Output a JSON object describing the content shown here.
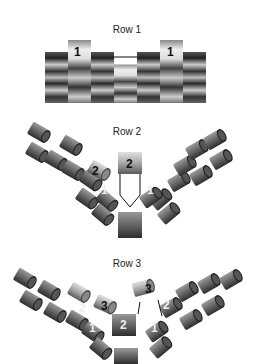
{
  "panels": [
    {
      "id": "row1",
      "title": "Row 1",
      "labels": [
        {
          "text": "1",
          "x": 79,
          "y": 55,
          "color": "#111"
        },
        {
          "text": "1",
          "x": 172,
          "y": 55,
          "color": "#111"
        }
      ]
    },
    {
      "id": "row2",
      "title": "Row 2",
      "labels": [
        {
          "text": "2",
          "x": 128,
          "y": 164,
          "color": "#111"
        },
        {
          "text": "2",
          "x": 95,
          "y": 172,
          "color": "#111"
        },
        {
          "text": "1",
          "x": 104,
          "y": 192,
          "color": "#eee"
        },
        {
          "text": "1",
          "x": 150,
          "y": 192,
          "color": "#eee"
        }
      ]
    },
    {
      "id": "row3",
      "title": "Row 3",
      "labels": [
        {
          "text": "3",
          "x": 148,
          "y": 292,
          "color": "#111"
        },
        {
          "text": "3",
          "x": 104,
          "y": 308,
          "color": "#111"
        },
        {
          "text": "2",
          "x": 82,
          "y": 310,
          "color": "#eee"
        },
        {
          "text": "2",
          "x": 166,
          "y": 307,
          "color": "#eee"
        },
        {
          "text": "2",
          "x": 123,
          "y": 326,
          "color": "#eee"
        },
        {
          "text": "1",
          "x": 92,
          "y": 330,
          "color": "#eee"
        },
        {
          "text": "1",
          "x": 154,
          "y": 330,
          "color": "#eee"
        }
      ]
    }
  ],
  "colors": {
    "bead_dark": "#3a3a3a",
    "bead_mid": "#7a7a7a",
    "bead_light": "#d8d8d8",
    "thread": "#111111"
  }
}
